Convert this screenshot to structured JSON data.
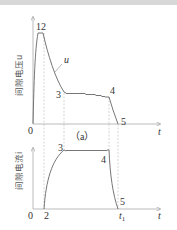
{
  "diagram": {
    "top_plot": {
      "ylabel": "间隙电压u",
      "curve_label": "u",
      "points": [
        "12",
        "3",
        "4",
        "5"
      ],
      "origin": "0",
      "x_axis": "t"
    },
    "caption": "（a）",
    "bottom_plot": {
      "ylabel": "间隙电流i",
      "points": [
        "3",
        "4",
        "5"
      ],
      "origin": "0",
      "start_point": "2",
      "end_time": "t",
      "end_time_sub": "1",
      "x_axis": "t"
    }
  }
}
